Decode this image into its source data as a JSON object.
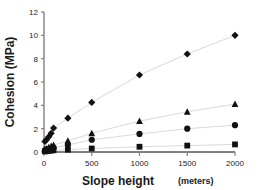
{
  "chart_data": {
    "type": "scatter",
    "title": "",
    "xlabel": "Slope height",
    "xlabel_unit": "(meters)",
    "ylabel": "Cohesion (MPa)",
    "xlim": [
      0,
      2000
    ],
    "ylim": [
      0,
      12
    ],
    "xticks": [
      0,
      500,
      1000,
      1500,
      2000
    ],
    "yticks": [
      0,
      2,
      4,
      6,
      8,
      10,
      12
    ],
    "grid": false,
    "legend": "none",
    "marker_color": "#111111",
    "line_color": "#d9d9d9",
    "axis_color": "#808080",
    "series": [
      {
        "name": "series-diamond",
        "marker": "diamond",
        "x": [
          10,
          25,
          50,
          75,
          100,
          250,
          500,
          1000,
          1500,
          2000
        ],
        "values": [
          0.9,
          1.05,
          1.3,
          1.6,
          2.05,
          2.9,
          4.25,
          6.6,
          8.4,
          10.0
        ]
      },
      {
        "name": "series-triangle",
        "marker": "triangle",
        "x": [
          10,
          25,
          50,
          75,
          100,
          250,
          500,
          1000,
          1500,
          2000
        ],
        "values": [
          0.25,
          0.3,
          0.4,
          0.5,
          0.6,
          0.95,
          1.6,
          2.65,
          3.45,
          4.1
        ]
      },
      {
        "name": "series-circle",
        "marker": "circle",
        "x": [
          10,
          25,
          50,
          75,
          100,
          250,
          500,
          1000,
          1500,
          2000
        ],
        "values": [
          0.15,
          0.2,
          0.25,
          0.3,
          0.35,
          0.6,
          1.05,
          1.55,
          2.0,
          2.3
        ]
      },
      {
        "name": "series-square",
        "marker": "square",
        "x": [
          10,
          25,
          50,
          75,
          100,
          250,
          500,
          1000,
          1500,
          2000
        ],
        "values": [
          0.05,
          0.07,
          0.1,
          0.12,
          0.15,
          0.2,
          0.3,
          0.45,
          0.55,
          0.65
        ]
      }
    ]
  }
}
